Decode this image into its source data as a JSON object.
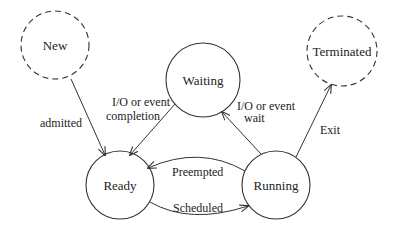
{
  "diagram": {
    "type": "state-transition",
    "colors": {
      "stroke": "#333333",
      "text": "#222222",
      "background": "#ffffff"
    },
    "states": [
      {
        "id": "new",
        "label": "New",
        "cx": 55,
        "cy": 45,
        "r": 34,
        "dashed": true
      },
      {
        "id": "waiting",
        "label": "Waiting",
        "cx": 203,
        "cy": 80,
        "r": 37,
        "dashed": false
      },
      {
        "id": "terminated",
        "label": "Terminated",
        "cx": 342,
        "cy": 51,
        "r": 35,
        "dashed": true
      },
      {
        "id": "ready",
        "label": "Ready",
        "cx": 120,
        "cy": 185,
        "r": 34,
        "dashed": false
      },
      {
        "id": "running",
        "label": "Running",
        "cx": 276,
        "cy": 185,
        "r": 34,
        "dashed": false
      }
    ],
    "transitions": [
      {
        "from": "new",
        "to": "ready",
        "label": [
          "admitted"
        ]
      },
      {
        "from": "waiting",
        "to": "ready",
        "label": [
          "I/O or event",
          "completion"
        ]
      },
      {
        "from": "running",
        "to": "waiting",
        "label": [
          "I/O or event",
          "wait"
        ]
      },
      {
        "from": "running",
        "to": "terminated",
        "label": [
          "Exit"
        ]
      },
      {
        "from": "running",
        "to": "ready",
        "label": [
          "Preempted"
        ]
      },
      {
        "from": "ready",
        "to": "running",
        "label": [
          "Scheduled"
        ]
      }
    ]
  }
}
